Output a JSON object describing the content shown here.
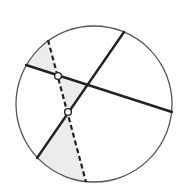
{
  "diagram": {
    "type": "geometry-circle-chords",
    "colors": {
      "background": "#ffffff",
      "stroke": "#222222",
      "circle_stroke": "#555555",
      "shade": "#ececec",
      "point_fill": "#ffffff"
    },
    "circle": {
      "cx": 94,
      "cy": 104,
      "r": 78
    },
    "solid_chords": [
      {
        "id": "chord-a",
        "x1": 124,
        "y1": 32,
        "x2": 37,
        "y2": 158
      },
      {
        "id": "chord-b",
        "x1": 26,
        "y1": 65,
        "x2": 172,
        "y2": 112
      }
    ],
    "dashed_line": {
      "x1": 48,
      "y1": 40,
      "x2": 86,
      "y2": 182
    },
    "points": [
      {
        "id": "upper-point",
        "x": 58,
        "y": 76
      },
      {
        "id": "lower-point",
        "x": 68,
        "y": 112
      }
    ],
    "shaded_regions": [
      {
        "id": "top-left-region",
        "path": "M 48 40 L 58 76 L 26 65 A 78 78 0 0 1 48 40 Z"
      },
      {
        "id": "middle-triangle",
        "path": "M 58 76 L 87 86 L 68 112 Z"
      },
      {
        "id": "bottom-region",
        "path": "M 68 112 L 86 182 A 78 78 0 0 1 37 158 Z"
      }
    ]
  }
}
